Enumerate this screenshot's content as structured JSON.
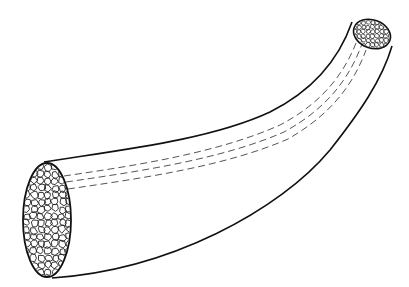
{
  "figure": {
    "colors": {
      "background": "#ffffff",
      "outline": "#111111",
      "dashes": "#555555",
      "cells": "#222222"
    }
  }
}
